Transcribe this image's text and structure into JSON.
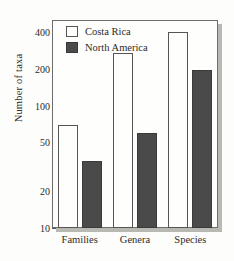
{
  "chart_data": {
    "type": "bar",
    "title": "",
    "subtitle": "",
    "xlabel": "",
    "ylabel": "Number of taxa",
    "categories": [
      "Families",
      "Genera",
      "Species"
    ],
    "series": [
      {
        "name": "Costa Rica",
        "values": [
          70,
          270,
          400
        ],
        "color": "#fefefc",
        "edge_color": "#555555"
      },
      {
        "name": "North America",
        "values": [
          35,
          60,
          195
        ],
        "color": "#4a4a4a",
        "edge_color": "#3a3a3a"
      }
    ],
    "yscale": "log",
    "ylim": [
      10,
      500
    ],
    "ytick_labels": [
      "400",
      "200",
      "100",
      "50",
      "20",
      "10"
    ],
    "ytick_values": [
      400,
      200,
      100,
      50,
      20,
      10
    ],
    "yminor_values": [
      15,
      30,
      40,
      60,
      70,
      80,
      90,
      150,
      250,
      300,
      350,
      450,
      500
    ],
    "grid": false,
    "legend_position": "top-left",
    "legend_entries": [
      "Costa Rica",
      "North America"
    ]
  }
}
